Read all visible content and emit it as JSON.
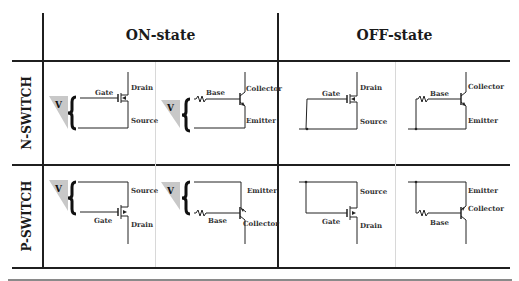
{
  "columns": {
    "on": "ON-state",
    "off": "OFF-state"
  },
  "rows": {
    "n": "N-SWITCH",
    "p": "P-SWITCH"
  },
  "voltage_symbol": "V",
  "mosfet_labels": {
    "gate": "Gate",
    "drain": "Drain",
    "source": "Source"
  },
  "bjt_labels": {
    "base": "Base",
    "collector": "Collector",
    "emitter": "Emitter"
  },
  "cells": {
    "n_on_mosfet": {
      "gate": "Gate",
      "top": "Drain",
      "bottom": "Source"
    },
    "n_on_bjt": {
      "base": "Base",
      "top": "Collector",
      "bottom": "Emitter"
    },
    "n_off_mosfet": {
      "gate": "Gate",
      "top": "Drain",
      "bottom": "Source"
    },
    "n_off_bjt": {
      "base": "Base",
      "top": "Collector",
      "bottom": "Emitter"
    },
    "p_on_mosfet": {
      "gate": "Gate",
      "top": "Source",
      "bottom": "Drain"
    },
    "p_on_bjt": {
      "base": "Base",
      "top": "Emitter",
      "bottom": "Collector"
    },
    "p_off_mosfet": {
      "gate": "Gate",
      "top": "Source",
      "bottom": "Drain"
    },
    "p_off_bjt": {
      "base": "Base",
      "top": "Emitter",
      "bottom": "Collector"
    }
  },
  "colors": {
    "line": "#1f1f1f",
    "triangle": "#c8c8c8",
    "faint_divider": "#d8d8d8"
  }
}
